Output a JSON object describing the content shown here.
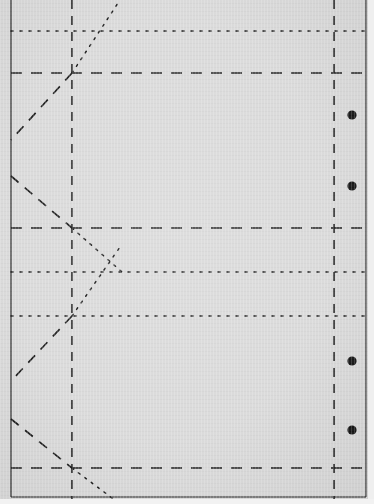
{
  "document": {
    "kind": "scanned-line-drawing",
    "title": "",
    "background_color": "#d9d9d9",
    "ink_color": "#1a1a1a",
    "width": 374,
    "height": 504
  },
  "canvas": {
    "width": 374,
    "height": 504
  },
  "frame": {
    "left_border": {
      "name": "left-frame-edge",
      "x": 11,
      "y1": 0,
      "y2": 497,
      "style": "solid",
      "width": 1.1
    },
    "right_border": {
      "name": "right-frame-edge",
      "x": 366,
      "y1": 0,
      "y2": 497,
      "style": "solid",
      "width": 1.1
    },
    "bottom_border": {
      "name": "bottom-frame-edge",
      "y": 497,
      "x1": 11,
      "x2": 366,
      "style": "solid",
      "width": 1.1
    }
  },
  "vertical_fold_lines": [
    {
      "name": "inner-vertical-fold",
      "x": 72,
      "y1": 0,
      "y2": 504,
      "style": "dashed",
      "dash": "9,7",
      "width": 1.6
    },
    {
      "name": "outer-vertical-fold",
      "x": 334,
      "y1": 0,
      "y2": 504,
      "style": "dashed",
      "dash": "9,7",
      "width": 1.6
    }
  ],
  "horizontal_lines": [
    {
      "name": "fold-line-dotted-1",
      "y": 31,
      "x1": 11,
      "x2": 374,
      "style": "dotted",
      "dash": "2,7",
      "width": 1.5
    },
    {
      "name": "fold-line-dashed-1",
      "y": 73,
      "x1": 11,
      "x2": 374,
      "style": "dashed",
      "dash": "11,9",
      "width": 1.7
    },
    {
      "name": "fold-line-dotted-2",
      "y": 228,
      "x1": 11,
      "x2": 374,
      "style": "dashed",
      "dash": "11,9",
      "width": 1.7
    },
    {
      "name": "fold-line-dashed-2",
      "y": 272,
      "x1": 11,
      "x2": 374,
      "style": "dotted",
      "dash": "2,7",
      "width": 1.5
    },
    {
      "name": "fold-line-dotted-3",
      "y": 316,
      "x1": 11,
      "x2": 374,
      "style": "dotted",
      "dash": "2,7",
      "width": 1.5
    },
    {
      "name": "fold-line-dashed-3",
      "y": 468,
      "x1": 11,
      "x2": 374,
      "style": "dashed",
      "dash": "11,9",
      "width": 1.7
    }
  ],
  "diagonal_lines": [
    {
      "name": "diagonal-dotted-upper-right",
      "x1": 72,
      "y1": 73,
      "x2": 120,
      "y2": 0,
      "style": "dotted",
      "dash": "2,6",
      "width": 1.5
    },
    {
      "name": "diagonal-dashed-upper-left",
      "x1": 72,
      "y1": 73,
      "x2": 11,
      "y2": 140,
      "style": "dashed",
      "dash": "10,8",
      "width": 1.7
    },
    {
      "name": "diagonal-dashed-lower-left",
      "x1": 11,
      "y1": 176,
      "x2": 72,
      "y2": 228,
      "style": "dashed",
      "dash": "10,8",
      "width": 1.7
    },
    {
      "name": "diagonal-dotted-mid-right",
      "x1": 72,
      "y1": 228,
      "x2": 122,
      "y2": 272,
      "style": "dotted",
      "dash": "2,6",
      "width": 1.5
    },
    {
      "name": "diagonal-dotted-lower-right",
      "x1": 72,
      "y1": 316,
      "x2": 120,
      "y2": 247,
      "style": "dotted",
      "dash": "2,6",
      "width": 1.5
    },
    {
      "name": "diagonal-dashed-low-left",
      "x1": 72,
      "y1": 316,
      "x2": 11,
      "y2": 381,
      "style": "dashed",
      "dash": "10,8",
      "width": 1.7
    },
    {
      "name": "diagonal-dashed-bottom-left",
      "x1": 11,
      "y1": 419,
      "x2": 72,
      "y2": 468,
      "style": "dashed",
      "dash": "10,8",
      "width": 1.7
    },
    {
      "name": "diagonal-dotted-bottom-right",
      "x1": 72,
      "y1": 468,
      "x2": 120,
      "y2": 504,
      "style": "dotted",
      "dash": "2,6",
      "width": 1.5
    }
  ],
  "punch_dots": [
    {
      "name": "punch-dot-1",
      "cx": 352,
      "cy": 115,
      "r": 4.6,
      "color": "#141414"
    },
    {
      "name": "punch-dot-2",
      "cx": 352,
      "cy": 186,
      "r": 4.6,
      "color": "#141414"
    },
    {
      "name": "punch-dot-3",
      "cx": 352,
      "cy": 361,
      "r": 4.6,
      "color": "#141414"
    },
    {
      "name": "punch-dot-4",
      "cx": 352,
      "cy": 430,
      "r": 4.6,
      "color": "#141414"
    }
  ]
}
